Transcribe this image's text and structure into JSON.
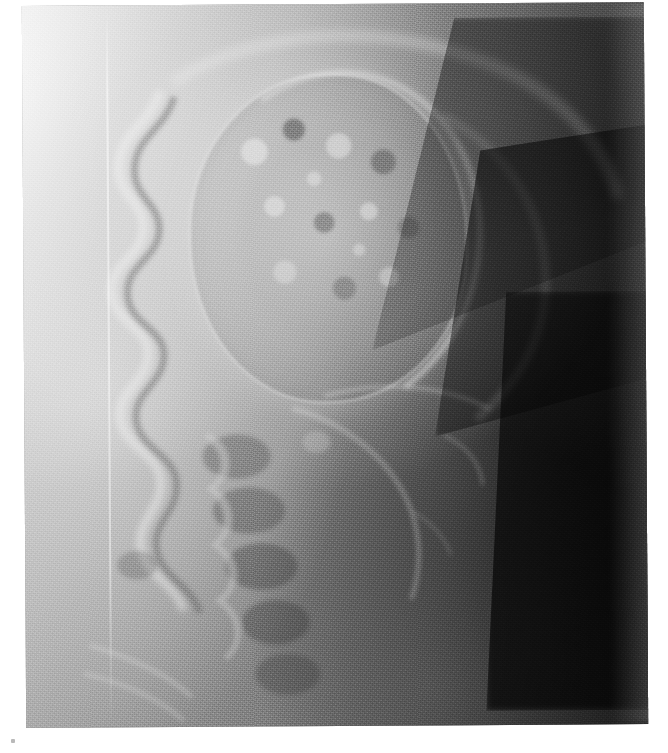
{
  "image": {
    "kind": "radiograph",
    "modality": "X-ray",
    "projection": "lateral",
    "region": "skull / facial bones and upper cervical spine",
    "alt_text": "Lateral plain radiograph of the skull and face showing a large well-circumscribed rounded mass lesion with coarse internal mottled calcific texture in the mid-face region, a scalloped anterior facial bone contour, cervical vertebral bodies inferiorly, and dark collimated air-density wedges at the right of the field.",
    "orientation_note": "patient facing left",
    "border_color": "#ffffff",
    "tones": {
      "highlight": "#e8e8e8",
      "bone_light": "#d0d0d0",
      "soft_tissue_mid": "#808080",
      "air_dark": "#3a3a3a",
      "collimation_black": "#0d0d0d"
    },
    "features": [
      {
        "name": "mass-lesion",
        "description": "large rounded expansile mass with mottled internal calcification",
        "position": "upper-middle"
      },
      {
        "name": "sclerotic-rim",
        "description": "bright dense rim along the superior and posterior margin of the mass",
        "position": "upper-right of mass"
      },
      {
        "name": "facial-contour",
        "description": "undulating scalloped anterior bony contour of the face",
        "position": "left"
      },
      {
        "name": "cervical-vertebrae",
        "description": "stacked vertebral bodies and spinous processes",
        "position": "lower-left of centre"
      },
      {
        "name": "collimation-wedge",
        "description": "sharp angular dark collimated field edges",
        "position": "upper-right and right"
      },
      {
        "name": "processing-line",
        "description": "faint vertical bright processing artefact line",
        "position": "left third"
      },
      {
        "name": "film-speck",
        "description": "small grey speck on the white film border",
        "position": "lower-left border"
      }
    ]
  }
}
